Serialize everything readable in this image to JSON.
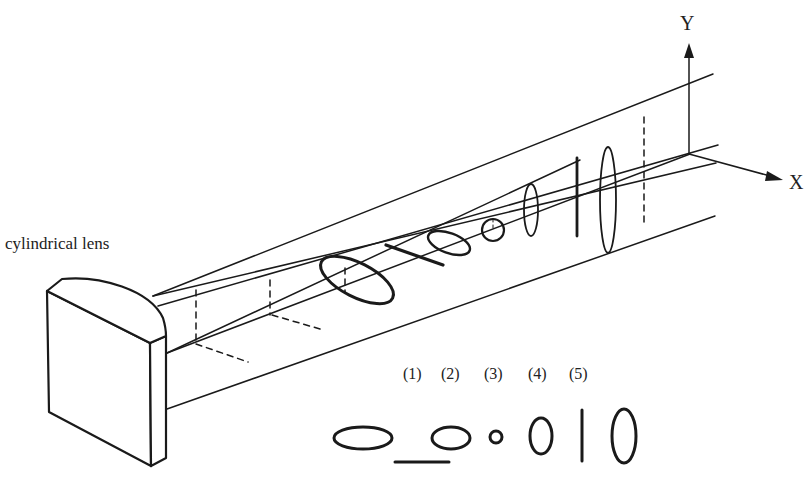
{
  "figure": {
    "labels": {
      "lens": "cylindrical lens",
      "y_axis": "Y",
      "x_axis": "X"
    },
    "cross_section_indices": [
      "(1)",
      "(2)",
      "(3)",
      "(4)",
      "(5)"
    ],
    "cross_section_shapes": [
      "horizontal-ellipse",
      "horizontal-line",
      "small-horizontal-ellipse",
      "circle",
      "vertical-ellipse",
      "vertical-line",
      "large-vertical-ellipse"
    ],
    "colors": {
      "stroke": "#1a1a1a",
      "background": "#ffffff"
    }
  }
}
